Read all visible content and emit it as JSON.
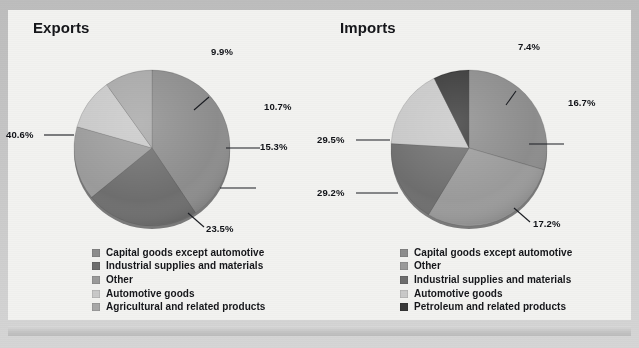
{
  "chart_data": [
    {
      "type": "pie",
      "title": "Exports",
      "categories": [
        "Capital goods except automotive",
        "Industrial supplies and materials",
        "Other",
        "Automotive goods",
        "Agricultural and related products"
      ],
      "values": [
        40.6,
        23.5,
        15.3,
        10.7,
        9.9
      ],
      "labels": [
        "40.6%",
        "23.5%",
        "15.3%",
        "10.7%",
        "9.9%"
      ],
      "colors": [
        "#8d8d8d",
        "#6e6e6e",
        "#9b9b9b",
        "#c9c9c9",
        "#a8a8a8"
      ],
      "xlabel": "",
      "ylabel": "",
      "legend_position": "bottom",
      "grid": false,
      "start_angle_deg": 0,
      "direction": "clockwise"
    },
    {
      "type": "pie",
      "title": "Imports",
      "categories": [
        "Capital goods except automotive",
        "Other",
        "Industrial supplies and materials",
        "Automotive goods",
        "Petroleum and related products"
      ],
      "values": [
        29.5,
        29.2,
        17.2,
        16.7,
        7.4
      ],
      "labels": [
        "29.5%",
        "29.2%",
        "17.2%",
        "16.7%",
        "7.4%"
      ],
      "colors": [
        "#8d8d8d",
        "#9b9b9b",
        "#6e6e6e",
        "#c9c9c9",
        "#3a3a3a"
      ],
      "xlabel": "",
      "ylabel": "",
      "legend_position": "bottom",
      "grid": false,
      "start_angle_deg": 0,
      "direction": "clockwise"
    }
  ],
  "exports": {
    "title": "Exports",
    "pct": {
      "top": "9.9%",
      "upper_right": "10.7%",
      "right": "15.3%",
      "lower_right": "23.5%",
      "left": "40.6%"
    },
    "legend": [
      {
        "label": "Capital goods except automotive",
        "color": "#8d8d8d"
      },
      {
        "label": "Industrial supplies and materials",
        "color": "#6e6e6e"
      },
      {
        "label": "Other",
        "color": "#9b9b9b"
      },
      {
        "label": "Automotive goods",
        "color": "#c9c9c9"
      },
      {
        "label": "Agricultural and related products",
        "color": "#a8a8a8"
      }
    ]
  },
  "imports": {
    "title": "Imports",
    "pct": {
      "top": "7.4%",
      "right": "16.7%",
      "lower_right": "17.2%",
      "lower_left": "29.2%",
      "left": "29.5%"
    },
    "legend": [
      {
        "label": "Capital goods except automotive",
        "color": "#8d8d8d"
      },
      {
        "label": "Other",
        "color": "#9b9b9b"
      },
      {
        "label": "Industrial supplies and materials",
        "color": "#6e6e6e"
      },
      {
        "label": "Automotive goods",
        "color": "#c9c9c9"
      },
      {
        "label": "Petroleum and related products",
        "color": "#3a3a3a"
      }
    ]
  }
}
